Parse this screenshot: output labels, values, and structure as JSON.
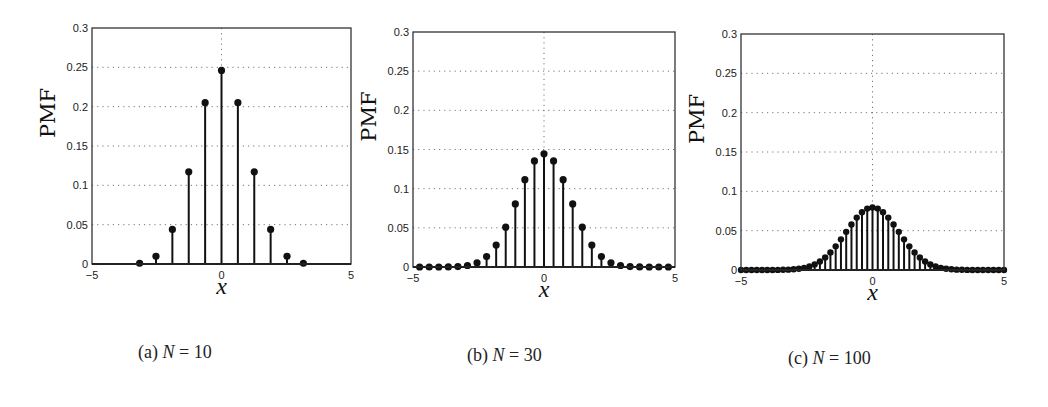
{
  "figure": {
    "captions": [
      {
        "label": "(a)",
        "var": "N",
        "eq": "= 10"
      },
      {
        "label": "(b)",
        "var": "N",
        "eq": "= 30"
      },
      {
        "label": "(c)",
        "var": "N",
        "eq": "= 100"
      }
    ]
  },
  "chart_data": [
    {
      "type": "stem",
      "title": "(a) N = 10",
      "xlabel": "x",
      "ylabel": "PMF",
      "xlim": [
        -5,
        5
      ],
      "ylim": [
        0,
        0.3
      ],
      "xticks": [
        -5,
        0,
        5
      ],
      "yticks": [
        0,
        0.05,
        0.1,
        0.15,
        0.2,
        0.25,
        0.3
      ],
      "xtick_labels": [
        "-5",
        "0",
        "5"
      ],
      "ytick_labels": [
        "0",
        "0.05",
        "0.1",
        "0.15",
        "0.2",
        "0.25",
        "0.3"
      ],
      "grid": "dotted",
      "x": [
        -3.162,
        -2.53,
        -1.897,
        -1.265,
        -0.632,
        0,
        0.632,
        1.265,
        1.897,
        2.53,
        3.162
      ],
      "values": [
        0.000977,
        0.009766,
        0.043945,
        0.117188,
        0.205078,
        0.246094,
        0.205078,
        0.117188,
        0.043945,
        0.009766,
        0.000977
      ]
    },
    {
      "type": "stem",
      "title": "(b) N = 30",
      "xlabel": "x",
      "ylabel": "PMF",
      "xlim": [
        -5,
        5
      ],
      "ylim": [
        0,
        0.3
      ],
      "xticks": [
        -5,
        0,
        5
      ],
      "yticks": [
        0,
        0.05,
        0.1,
        0.15,
        0.2,
        0.25,
        0.3
      ],
      "xtick_labels": [
        "-5",
        "0",
        "5"
      ],
      "ytick_labels": [
        "0",
        "0.05",
        "0.1",
        "0.15",
        "0.2",
        "0.25",
        "0.3"
      ],
      "grid": "dotted",
      "x": [
        -4.747,
        -4.382,
        -4.017,
        -3.651,
        -3.286,
        -2.921,
        -2.556,
        -2.191,
        -1.826,
        -1.461,
        -1.095,
        -0.73,
        -0.365,
        0,
        0.365,
        0.73,
        1.095,
        1.461,
        1.826,
        2.191,
        2.556,
        2.921,
        3.286,
        3.651,
        4.017,
        4.382,
        4.747
      ],
      "values": [
        4e-07,
        3.8e-06,
        2.55e-05,
        0.000133,
        0.000553,
        0.001896,
        0.005451,
        0.013324,
        0.027982,
        0.050876,
        0.080553,
        0.111535,
        0.135435,
        0.144465,
        0.135435,
        0.111535,
        0.080553,
        0.050876,
        0.027982,
        0.013324,
        0.005451,
        0.001896,
        0.000553,
        0.000133,
        2.55e-05,
        3.8e-06,
        4e-07
      ]
    },
    {
      "type": "stem",
      "title": "(c) N = 100",
      "xlabel": "x",
      "ylabel": "PMF",
      "xlim": [
        -5,
        5
      ],
      "ylim": [
        0,
        0.3
      ],
      "xticks": [
        -5,
        0,
        5
      ],
      "yticks": [
        0,
        0.05,
        0.1,
        0.15,
        0.2,
        0.25,
        0.3
      ],
      "xtick_labels": [
        "-5",
        "0",
        "5"
      ],
      "ytick_labels": [
        "0",
        "0.05",
        "0.1",
        "0.15",
        "0.2",
        "0.25",
        "0.3"
      ],
      "grid": "dotted",
      "x": [
        -5.0,
        -4.8,
        -4.6,
        -4.4,
        -4.2,
        -4.0,
        -3.8,
        -3.6,
        -3.4,
        -3.2,
        -3.0,
        -2.8,
        -2.6,
        -2.4,
        -2.2,
        -2.0,
        -1.8,
        -1.6,
        -1.4,
        -1.2,
        -1.0,
        -0.8,
        -0.6,
        -0.4,
        -0.2,
        0,
        0.2,
        0.4,
        0.6,
        0.8,
        1.0,
        1.2,
        1.4,
        1.6,
        1.8,
        2.0,
        2.2,
        2.4,
        2.6,
        2.8,
        3.0,
        3.2,
        3.4,
        3.6,
        3.8,
        4.0,
        4.2,
        4.4,
        4.6,
        4.8,
        5.0
      ],
      "values": [
        2e-07,
        6e-07,
        1.6e-06,
        4e-06,
        9.9e-06,
        2.32e-05,
        5.23e-05,
        0.000113,
        0.000232,
        0.000458,
        0.000864,
        0.00156,
        0.002698,
        0.004473,
        0.007111,
        0.010844,
        0.015869,
        0.022292,
        0.030069,
        0.038952,
        0.048474,
        0.057958,
        0.06659,
        0.073527,
        0.078029,
        0.079589,
        0.078029,
        0.073527,
        0.06659,
        0.057958,
        0.048474,
        0.038952,
        0.030069,
        0.022292,
        0.015869,
        0.010844,
        0.007111,
        0.004473,
        0.002698,
        0.00156,
        0.000864,
        0.000458,
        0.000232,
        0.000113,
        5.23e-05,
        2.32e-05,
        9.9e-06,
        4e-06,
        1.6e-06,
        6e-07,
        2e-07
      ]
    }
  ]
}
